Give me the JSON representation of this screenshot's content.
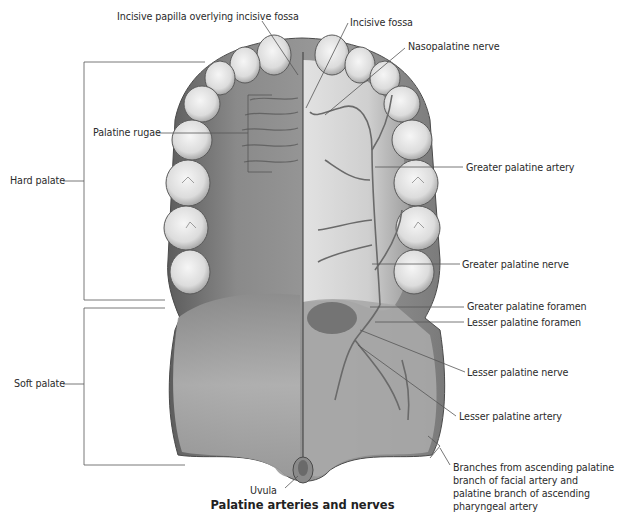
{
  "figure": {
    "title": "Palatine arteries and nerves",
    "labels": {
      "incisive_papilla": "Incisive papilla overlying incisive fossa",
      "incisive_fossa": "Incisive fossa",
      "nasopalatine_nerve": "Nasopalatine nerve",
      "palatine_rugae": "Palatine rugae",
      "hard_palate": "Hard palate",
      "greater_palatine_artery": "Greater palatine artery",
      "greater_palatine_nerve": "Greater palatine nerve",
      "greater_palatine_foramen": "Greater palatine foramen",
      "lesser_palatine_foramen": "Lesser palatine foramen",
      "soft_palate": "Soft palate",
      "lesser_palatine_nerve": "Lesser palatine nerve",
      "lesser_palatine_artery": "Lesser palatine artery",
      "ascending_branches": "Branches from ascending palatine branch of facial artery and palatine branch of ascending pharyngeal artery",
      "uvula": "Uvula"
    },
    "colors": {
      "leader_line": "#555555",
      "tissue_dark": "#6e6e6e",
      "tissue_light": "#bdbdbd",
      "tooth": "#e9e9e9",
      "vessel": "#777777"
    }
  }
}
